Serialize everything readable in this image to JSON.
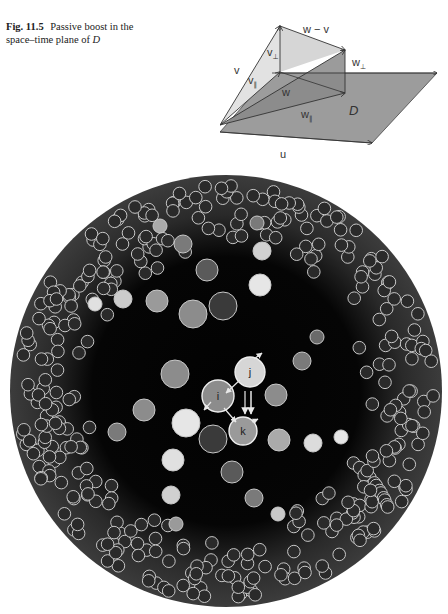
{
  "figure": {
    "label": "Fig. 11.5",
    "caption_text": "Passive boost in the space–time plane of",
    "caption_math": "D"
  },
  "diagram": {
    "plane_label": "D",
    "vectors": [
      {
        "id": "v",
        "label": "v"
      },
      {
        "id": "v_par",
        "label": "v",
        "subscript": "∥"
      },
      {
        "id": "v_perp",
        "label": "v",
        "subscript": "⊥"
      },
      {
        "id": "w",
        "label": "w"
      },
      {
        "id": "w_par",
        "label": "w",
        "subscript": "∥"
      },
      {
        "id": "w_perp",
        "label": "w",
        "subscript": "⊥"
      },
      {
        "id": "w_minus_v",
        "label": "w − v"
      },
      {
        "id": "u",
        "label": "u"
      }
    ]
  },
  "simulation": {
    "disk": {
      "cx": 226,
      "cy": 231,
      "r": 216
    },
    "colors": {
      "disk_edge": "#3a3a3a",
      "disk_center": "#020202",
      "ball_outline": "#c8c8c8",
      "small_ball_fill": "#2a2a2a"
    },
    "labeled_balls": [
      {
        "label": "i",
        "x": 218,
        "y": 236,
        "r": 16,
        "fill": "#8c8c8c"
      },
      {
        "label": "j",
        "x": 250,
        "y": 212,
        "r": 15,
        "fill": "#d6d6d6"
      },
      {
        "label": "k",
        "x": 243,
        "y": 271,
        "r": 14,
        "fill": "#9a9a9a"
      }
    ],
    "large_balls": [
      {
        "x": 160,
        "y": 66,
        "r": 7,
        "fill": "#aaaaaa"
      },
      {
        "x": 183,
        "y": 84,
        "r": 9,
        "fill": "#7a7a7a"
      },
      {
        "x": 207,
        "y": 110,
        "r": 11,
        "fill": "#5a5a5a"
      },
      {
        "x": 257,
        "y": 63,
        "r": 7,
        "fill": "#7a7a7a"
      },
      {
        "x": 262,
        "y": 91,
        "r": 9,
        "fill": "#d0d0d0"
      },
      {
        "x": 260,
        "y": 125,
        "r": 11,
        "fill": "#e6e6e6"
      },
      {
        "x": 223,
        "y": 146,
        "r": 14,
        "fill": "#3a3a3a"
      },
      {
        "x": 193,
        "y": 154,
        "r": 14,
        "fill": "#8c8c8c"
      },
      {
        "x": 157,
        "y": 141,
        "r": 11,
        "fill": "#9a9a9a"
      },
      {
        "x": 123,
        "y": 139,
        "r": 9,
        "fill": "#cccccc"
      },
      {
        "x": 95,
        "y": 144,
        "r": 7,
        "fill": "#e0e0e0"
      },
      {
        "x": 317,
        "y": 177,
        "r": 7,
        "fill": "#6a6a6a"
      },
      {
        "x": 302,
        "y": 201,
        "r": 9,
        "fill": "#7a7a7a"
      },
      {
        "x": 276,
        "y": 235,
        "r": 11,
        "fill": "#8c8c8c"
      },
      {
        "x": 175,
        "y": 214,
        "r": 14,
        "fill": "#8c8c8c"
      },
      {
        "x": 144,
        "y": 250,
        "r": 11,
        "fill": "#8c8c8c"
      },
      {
        "x": 117,
        "y": 272,
        "r": 9,
        "fill": "#7a7a7a"
      },
      {
        "x": 186,
        "y": 263,
        "r": 14,
        "fill": "#e6e6e6"
      },
      {
        "x": 213,
        "y": 279,
        "r": 14,
        "fill": "#3a3a3a"
      },
      {
        "x": 279,
        "y": 280,
        "r": 11,
        "fill": "#aaaaaa"
      },
      {
        "x": 313,
        "y": 283,
        "r": 9,
        "fill": "#dcdcdc"
      },
      {
        "x": 341,
        "y": 277,
        "r": 7,
        "fill": "#e6e6e6"
      },
      {
        "x": 173,
        "y": 300,
        "r": 11,
        "fill": "#e0e0e0"
      },
      {
        "x": 232,
        "y": 312,
        "r": 11,
        "fill": "#5a5a5a"
      },
      {
        "x": 171,
        "y": 335,
        "r": 9,
        "fill": "#d0d0d0"
      },
      {
        "x": 254,
        "y": 338,
        "r": 9,
        "fill": "#7a7a7a"
      },
      {
        "x": 176,
        "y": 364,
        "r": 7,
        "fill": "#9a9a9a"
      },
      {
        "x": 278,
        "y": 354,
        "r": 7,
        "fill": "#c8c8c8"
      }
    ]
  }
}
